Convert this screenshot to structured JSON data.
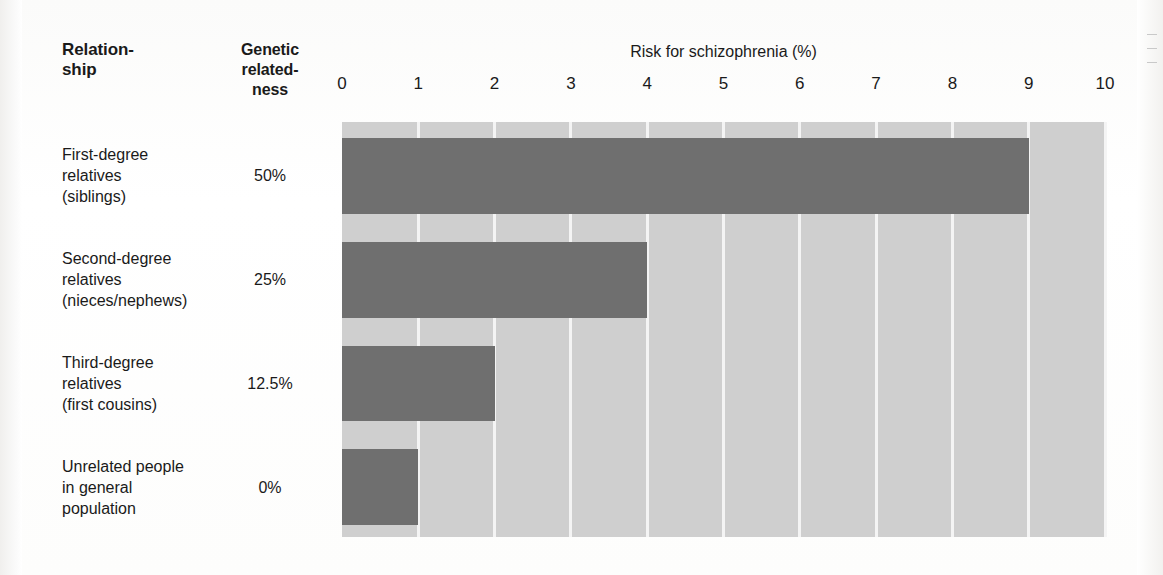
{
  "table_headers": {
    "relationship": "Relation-\nship",
    "genetic_relatedness": "Genetic\nrelated-\nness"
  },
  "chart_data": {
    "type": "bar",
    "orientation": "horizontal",
    "title": "Risk for schizophrenia (%)",
    "xlabel": "Risk for schizophrenia (%)",
    "ylabel": "Relationship",
    "xlim": [
      0,
      10
    ],
    "ticks": [
      0,
      1,
      2,
      3,
      4,
      5,
      6,
      7,
      8,
      9,
      10
    ],
    "tick_labels": [
      "0",
      "1",
      "2",
      "3",
      "4",
      "5",
      "6",
      "7",
      "8",
      "9",
      "10"
    ],
    "grid": true,
    "legend": "none",
    "categories": [
      "First-degree relatives (siblings)",
      "Second-degree relatives (nieces/nephews)",
      "Third-degree relatives (first cousins)",
      "Unrelated people in general population"
    ],
    "values": [
      9,
      4,
      2,
      1
    ],
    "genetic_relatedness": [
      "50%",
      "25%",
      "12.5%",
      "0%"
    ],
    "bar_color": "#6f6f6f",
    "plot_background": "#cfcfcf",
    "gridline_color": "#f4f4f4"
  },
  "rows": [
    {
      "label_lines": [
        "First-degree",
        "relatives",
        "(siblings)"
      ],
      "genetic_relatedness": "50%",
      "risk": 9
    },
    {
      "label_lines": [
        "Second-degree",
        "relatives",
        "(nieces/nephews)"
      ],
      "genetic_relatedness": "25%",
      "risk": 4
    },
    {
      "label_lines": [
        "Third-degree",
        "relatives",
        "(first cousins)"
      ],
      "genetic_relatedness": "12.5%",
      "risk": 2
    },
    {
      "label_lines": [
        "Unrelated people",
        "in general",
        "population"
      ],
      "genetic_relatedness": "0%",
      "risk": 1
    }
  ]
}
